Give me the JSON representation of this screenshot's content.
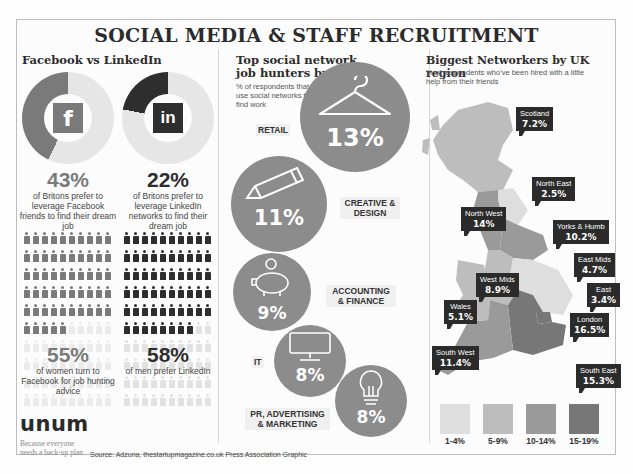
{
  "title": "SOCIAL MEDIA & STAFF RECRUITMENT",
  "left_section": {
    "title": "Facebook vs LinkedIn",
    "facebook": {
      "icon": "facebook-icon",
      "icon_glyph": "f",
      "percent": "43%",
      "description": "of Britons prefer to leverage Facebook friends to find their dream job",
      "color": "#7a7a7a"
    },
    "linkedin": {
      "icon": "linkedin-icon",
      "icon_glyph": "in",
      "percent": "22%",
      "description": "of Britons prefer to leverage LinkedIn networks to find their dream job",
      "color": "#2e2e2e"
    },
    "women": {
      "percent": "55%",
      "description": "of women turn to Facebook for job hunting advice",
      "count": 55
    },
    "men": {
      "percent": "58%",
      "description": "of men prefer LinkedIn",
      "count": 58
    }
  },
  "middle_section": {
    "title": "Top social network job hunters by sector",
    "subtitle": "% of respondents that use social networks to find work",
    "sectors": [
      {
        "label": "RETAIL",
        "value": "13%",
        "icon": "clothes-hanger-icon"
      },
      {
        "label": "CREATIVE & DESIGN",
        "value": "11%",
        "icon": "pencil-icon"
      },
      {
        "label": "ACCOUNTING & FINANCE",
        "value": "9%",
        "icon": "piggy-bank-icon"
      },
      {
        "label": "IT",
        "value": "8%",
        "icon": "monitor-icon"
      },
      {
        "label": "PR, ADVERTISING & MARKETING",
        "value": "8%",
        "icon": "lightbulb-icon"
      }
    ]
  },
  "right_section": {
    "title": "Biggest Networkers by UK region",
    "subtitle": "% of respondents who've been hired with a little help from their friends",
    "regions": [
      {
        "name": "Scotland",
        "value": "7.2%"
      },
      {
        "name": "North East",
        "value": "2.5%"
      },
      {
        "name": "North West",
        "value": "14%"
      },
      {
        "name": "Yorks & Humb",
        "value": "10.2%"
      },
      {
        "name": "East Mids",
        "value": "4.7%"
      },
      {
        "name": "West Mids",
        "value": "8.9%"
      },
      {
        "name": "East",
        "value": "3.4%"
      },
      {
        "name": "Wales",
        "value": "5.1%"
      },
      {
        "name": "London",
        "value": "16.5%"
      },
      {
        "name": "South West",
        "value": "11.4%"
      },
      {
        "name": "South East",
        "value": "15.3%"
      }
    ],
    "legend": [
      {
        "label": "1-4%",
        "color": "#dedede"
      },
      {
        "label": "5-9%",
        "color": "#bdbdbd"
      },
      {
        "label": "10-14%",
        "color": "#9a9a9a"
      },
      {
        "label": "15-19%",
        "color": "#777777"
      }
    ]
  },
  "footer": {
    "brand": "unum",
    "tagline_line1": "Because everyone",
    "tagline_line2": "needs a back-up plan",
    "source": "Source: Adzuna, thestartupmagazine.co.uk  Press Association Graphic"
  },
  "chart_data": [
    {
      "type": "pie",
      "title": "Facebook vs LinkedIn",
      "categories": [
        "Facebook",
        "LinkedIn"
      ],
      "values": [
        43,
        22
      ],
      "unit": "% of Britons preferring the network to find their dream job"
    },
    {
      "type": "bar",
      "title": "Pictogram: gender preference",
      "categories": [
        "Women turn to Facebook for job hunting advice",
        "Men prefer LinkedIn"
      ],
      "values": [
        55,
        58
      ],
      "ylim": [
        0,
        100
      ]
    },
    {
      "type": "bar",
      "title": "Top social network job hunters by sector",
      "subtitle": "% of respondents that use social networks to find work",
      "categories": [
        "Retail",
        "Creative & Design",
        "Accounting & Finance",
        "IT",
        "PR, Advertising & Marketing"
      ],
      "values": [
        13,
        11,
        9,
        8,
        8
      ]
    },
    {
      "type": "heatmap",
      "title": "Biggest Networkers by UK region",
      "subtitle": "% of respondents who've been hired with a little help from their friends",
      "categories": [
        "Scotland",
        "North East",
        "North West",
        "Yorks & Humb",
        "East Mids",
        "West Mids",
        "East",
        "Wales",
        "London",
        "South West",
        "South East"
      ],
      "values": [
        7.2,
        2.5,
        14,
        10.2,
        4.7,
        8.9,
        3.4,
        5.1,
        16.5,
        11.4,
        15.3
      ],
      "legend": [
        "1-4%",
        "5-9%",
        "10-14%",
        "15-19%"
      ]
    }
  ]
}
